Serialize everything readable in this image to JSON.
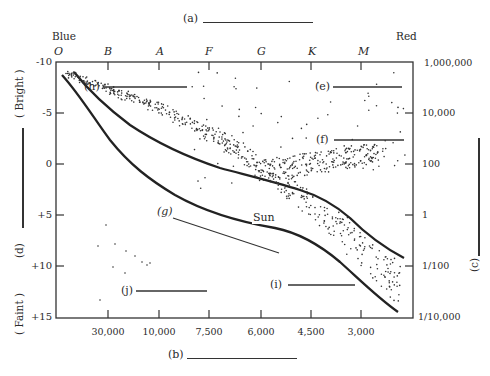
{
  "diagram": {
    "title_blank": "(a)",
    "x_label_blank": "(b)",
    "right_axis_blank": "(c)",
    "left_axis_blank": "(d)",
    "color_left": "Blue",
    "color_right": "Red",
    "bright_label": "( Bright )",
    "faint_label": "( Faint )",
    "sun_label": "Sun",
    "region_labels": {
      "e": "(e)",
      "f": "(f)",
      "g": "(g)",
      "h": "(h)",
      "i": "(i)",
      "j": "(j)"
    },
    "spectral_classes": [
      "O",
      "B",
      "A",
      "F",
      "G",
      "K",
      "M"
    ],
    "left_ticks": [
      "-10",
      "-5",
      "0",
      "+5",
      "+10",
      "+15"
    ],
    "right_ticks": [
      "1,000,000",
      "10,000",
      "100",
      "1",
      "1/100",
      "1/10,000"
    ],
    "bottom_ticks": [
      "30,000",
      "10,000",
      "7,500",
      "6,000",
      "4,500",
      "3,000"
    ]
  },
  "chart_data": {
    "type": "scatter",
    "xlabel": "(b) ________",
    "ylabel_left": "(d) ________",
    "ylabel_right": "(c) ________",
    "x_top_categories": [
      "O",
      "B",
      "A",
      "F",
      "G",
      "K",
      "M"
    ],
    "x_bottom_ticks": [
      30000,
      10000,
      7500,
      6000,
      4500,
      3000
    ],
    "y_left_ticks": [
      -10,
      -5,
      0,
      5,
      10,
      15
    ],
    "y_left_range": [
      -10,
      15
    ],
    "y_right_ticks": [
      "1,000,000",
      "10,000",
      "100",
      "1",
      "1/100",
      "1/10,000"
    ],
    "annotations": [
      "Blue",
      "Red",
      "Bright",
      "Faint",
      "Sun",
      "(e)",
      "(f)",
      "(g)",
      "(h)",
      "(i)",
      "(j)"
    ],
    "regions": [
      {
        "label": "(h)",
        "description": "upper-left stars (supergiants/blue)"
      },
      {
        "label": "(e)",
        "description": "upper-right sparse stars"
      },
      {
        "label": "(f)",
        "description": "giant branch cluster near magnitude 0"
      },
      {
        "label": "(g)",
        "description": "main sequence band"
      },
      {
        "label": "(i)",
        "description": "lower-right end of band"
      },
      {
        "label": "(j)",
        "description": "lower-left faint stars"
      }
    ],
    "grid": false
  }
}
